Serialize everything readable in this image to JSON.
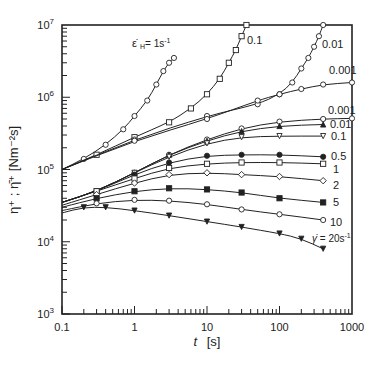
{
  "chart_data": {
    "type": "line",
    "title": "",
    "xlabel": "t  [s]",
    "ylabel": "η⁺ ; η̄⁺ [Nm⁻²s]",
    "xscale": "log",
    "yscale": "log",
    "xlim": [
      0.1,
      1000
    ],
    "ylim": [
      1000,
      10000000
    ],
    "x_ticks": [
      "0.1",
      "1",
      "10",
      "100",
      "1000"
    ],
    "y_ticks": [
      "10^3",
      "10^4",
      "10^5",
      "10^6",
      "10^7"
    ],
    "grid": false,
    "legend": "inline labels at curve ends",
    "series": [
      {
        "name": "ε̇H = 1s⁻¹",
        "group": "extensional",
        "marker": "open-circle",
        "label": "ε̇H= 1s-1",
        "points": [
          [
            0.1,
            100000.0
          ],
          [
            0.2,
            140000.0
          ],
          [
            0.4,
            220000.0
          ],
          [
            0.7,
            360000.0
          ],
          [
            1.0,
            550000.0
          ],
          [
            1.5,
            900000.0
          ],
          [
            2.0,
            1500000.0
          ],
          [
            2.5,
            2300000.0
          ],
          [
            3.0,
            3000000.0
          ],
          [
            3.5,
            3500000.0
          ]
        ]
      },
      {
        "name": "ε̇H = 0.1s⁻¹",
        "group": "extensional",
        "marker": "open-square",
        "label": "0.1",
        "points": [
          [
            0.1,
            100000.0
          ],
          [
            0.3,
            160000.0
          ],
          [
            1,
            280000.0
          ],
          [
            3,
            450000.0
          ],
          [
            6,
            700000.0
          ],
          [
            10,
            1100000.0
          ],
          [
            15,
            1800000.0
          ],
          [
            20,
            3000000.0
          ],
          [
            25,
            4500000.0
          ],
          [
            30,
            7000000.0
          ],
          [
            35,
            10000000.0
          ]
        ]
      },
      {
        "name": "ε̇H = 0.01s⁻¹",
        "group": "extensional",
        "marker": "open-circle",
        "label": "0.01",
        "points": [
          [
            0.1,
            100000.0
          ],
          [
            1,
            260000.0
          ],
          [
            10,
            550000.0
          ],
          [
            50,
            800000.0
          ],
          [
            100,
            1100000.0
          ],
          [
            150,
            1600000.0
          ],
          [
            200,
            2500000.0
          ],
          [
            250,
            3500000.0
          ],
          [
            300,
            5000000.0
          ],
          [
            350,
            7000000.0
          ],
          [
            400,
            10000000.0
          ]
        ]
      },
      {
        "name": "ε̇H = 0.001s⁻¹",
        "group": "extensional",
        "marker": "open-circle",
        "label": "0.001",
        "points": [
          [
            0.1,
            100000.0
          ],
          [
            1,
            250000.0
          ],
          [
            10,
            500000.0
          ],
          [
            50,
            900000.0
          ],
          [
            100,
            1100000.0
          ],
          [
            200,
            1300000.0
          ],
          [
            400,
            1500000.0
          ],
          [
            1000,
            1600000.0
          ]
        ]
      },
      {
        "name": "γ̇ = 0.001s⁻¹",
        "group": "shear",
        "marker": "open-circle",
        "label": "0.001",
        "points": [
          [
            0.1,
            35000.0
          ],
          [
            0.3,
            50000.0
          ],
          [
            1,
            90000.0
          ],
          [
            3,
            160000.0
          ],
          [
            10,
            260000.0
          ],
          [
            30,
            370000.0
          ],
          [
            100,
            460000.0
          ],
          [
            400,
            500000.0
          ],
          [
            1000,
            510000.0
          ]
        ]
      },
      {
        "name": "γ̇ = 0.01s⁻¹",
        "group": "shear",
        "marker": "filled-triangle",
        "label": "0.01",
        "points": [
          [
            0.1,
            35000.0
          ],
          [
            0.3,
            50000.0
          ],
          [
            1,
            90000.0
          ],
          [
            3,
            160000.0
          ],
          [
            10,
            250000.0
          ],
          [
            30,
            340000.0
          ],
          [
            100,
            400000.0
          ],
          [
            400,
            420000.0
          ]
        ]
      },
      {
        "name": "γ̇ = 0.1s⁻¹",
        "group": "shear",
        "marker": "open-inverted-triangle",
        "label": "0.1",
        "points": [
          [
            0.1,
            35000.0
          ],
          [
            0.3,
            50000.0
          ],
          [
            1,
            90000.0
          ],
          [
            3,
            150000.0
          ],
          [
            10,
            230000.0
          ],
          [
            30,
            280000.0
          ],
          [
            100,
            290000.0
          ],
          [
            400,
            290000.0
          ]
        ]
      },
      {
        "name": "γ̇ = 0.5s⁻¹",
        "group": "shear",
        "marker": "filled-circle",
        "label": "0.5",
        "points": [
          [
            0.1,
            35000.0
          ],
          [
            0.3,
            50000.0
          ],
          [
            1,
            85000.0
          ],
          [
            3,
            125000.0
          ],
          [
            10,
            155000.0
          ],
          [
            30,
            160000.0
          ],
          [
            100,
            160000.0
          ],
          [
            400,
            150000.0
          ]
        ]
      },
      {
        "name": "γ̇ = 1s⁻¹",
        "group": "shear",
        "marker": "open-square",
        "label": "1",
        "points": [
          [
            0.1,
            35000.0
          ],
          [
            0.3,
            50000.0
          ],
          [
            1,
            75000.0
          ],
          [
            3,
            105000.0
          ],
          [
            10,
            120000.0
          ],
          [
            30,
            125000.0
          ],
          [
            100,
            125000.0
          ],
          [
            400,
            120000.0
          ]
        ]
      },
      {
        "name": "γ̇ = 2s⁻¹",
        "group": "shear",
        "marker": "open-diamond",
        "label": "2",
        "points": [
          [
            0.1,
            32000.0
          ],
          [
            0.3,
            45000.0
          ],
          [
            1,
            65000.0
          ],
          [
            3,
            85000.0
          ],
          [
            10,
            90000.0
          ],
          [
            30,
            85000.0
          ],
          [
            100,
            80000.0
          ],
          [
            400,
            70000.0
          ]
        ]
      },
      {
        "name": "γ̇ = 5s⁻¹",
        "group": "shear",
        "marker": "filled-square",
        "label": "5",
        "points": [
          [
            0.1,
            30000.0
          ],
          [
            0.3,
            40000.0
          ],
          [
            1,
            50000.0
          ],
          [
            3,
            55000.0
          ],
          [
            10,
            53000.0
          ],
          [
            30,
            48000.0
          ],
          [
            100,
            40000.0
          ],
          [
            400,
            35000.0
          ]
        ]
      },
      {
        "name": "γ̇ = 10s⁻¹",
        "group": "shear",
        "marker": "open-circle",
        "label": "10",
        "points": [
          [
            0.1,
            27000.0
          ],
          [
            0.3,
            34000.0
          ],
          [
            1,
            38000.0
          ],
          [
            3,
            37000.0
          ],
          [
            10,
            33000.0
          ],
          [
            30,
            28000.0
          ],
          [
            100,
            24000.0
          ],
          [
            400,
            20000.0
          ]
        ]
      },
      {
        "name": "γ̇ = 20s⁻¹",
        "group": "shear",
        "marker": "filled-inverted-triangle",
        "label": "γ̇ = 20s-1",
        "points": [
          [
            0.1,
            25000.0
          ],
          [
            0.2,
            30000.0
          ],
          [
            0.4,
            30000.0
          ],
          [
            1,
            27000.0
          ],
          [
            3,
            23000.0
          ],
          [
            10,
            19000.0
          ],
          [
            30,
            16000.0
          ],
          [
            100,
            13000.0
          ],
          [
            200,
            11000.0
          ],
          [
            400,
            8000.0
          ]
        ]
      }
    ]
  },
  "axes": {
    "xlabel_italic": "t",
    "xlabel_unit": "[s]",
    "ylabel": "η⁺ ; η̄⁺  [Nm⁻²s]"
  },
  "colors": {
    "ink": "#222222",
    "background": "#ffffff"
  }
}
